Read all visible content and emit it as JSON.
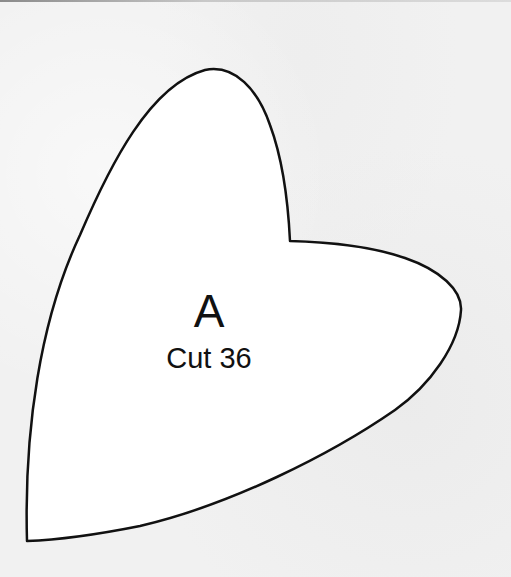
{
  "pattern_piece": {
    "letter": "A",
    "instruction": "Cut 36",
    "fill_color": "#ffffff",
    "stroke_color": "#111111",
    "background_color": "#f1f1f1"
  }
}
